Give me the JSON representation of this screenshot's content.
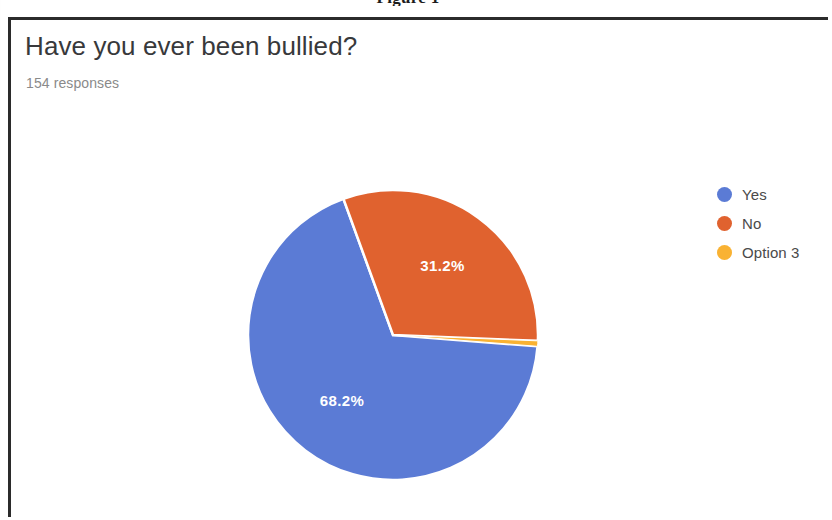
{
  "figure": {
    "caption": "Figure 1"
  },
  "card": {
    "question_title": "Have you ever been bullied?",
    "response_count": "154 responses"
  },
  "legend": {
    "items": [
      {
        "label": "Yes",
        "color": "#5b7bd5"
      },
      {
        "label": "No",
        "color": "#e0622f"
      },
      {
        "label": "Option 3",
        "color": "#f9b233"
      }
    ]
  },
  "chart_data": {
    "type": "pie",
    "title": "Have you ever been bullied?",
    "subtitle": "154 responses",
    "total_responses": 154,
    "labels": [
      "Yes",
      "No",
      "Option 3"
    ],
    "values": [
      68.2,
      31.2,
      0.6
    ],
    "value_suffix": "%",
    "data_labels": [
      "68.2%",
      "31.2%",
      ""
    ],
    "colors": [
      "#5b7bd5",
      "#e0622f",
      "#f9b233"
    ],
    "legend_position": "right",
    "grid": false,
    "start_angle_deg": -20,
    "direction": "clockwise"
  },
  "slice_labels": {
    "no": "31.2%",
    "yes": "68.2%"
  },
  "colors": {
    "blue": "#5b7bd5",
    "orange": "#e0622f",
    "amber": "#f9b233",
    "card_border": "#2b2b2b",
    "title_text": "#38393b",
    "muted_text": "#8a8a8a"
  }
}
